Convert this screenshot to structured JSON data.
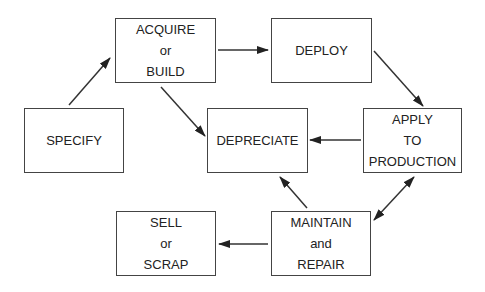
{
  "diagram": {
    "nodes": [
      {
        "id": "acquire",
        "lines": [
          "ACQUIRE",
          "or",
          "BUILD"
        ],
        "x": 115,
        "y": 18,
        "w": 101,
        "h": 65
      },
      {
        "id": "deploy",
        "lines": [
          "DEPLOY"
        ],
        "x": 271,
        "y": 18,
        "w": 101,
        "h": 65
      },
      {
        "id": "specify",
        "lines": [
          "SPECIFY"
        ],
        "x": 24,
        "y": 108,
        "w": 100,
        "h": 65
      },
      {
        "id": "depreciate",
        "lines": [
          "DEPRECIATE"
        ],
        "x": 207,
        "y": 108,
        "w": 101,
        "h": 65
      },
      {
        "id": "apply",
        "lines": [
          "APPLY",
          "TO",
          "PRODUCTION"
        ],
        "x": 363,
        "y": 108,
        "w": 99,
        "h": 65
      },
      {
        "id": "sell",
        "lines": [
          "SELL",
          "or",
          "SCRAP"
        ],
        "x": 116,
        "y": 211,
        "w": 100,
        "h": 65
      },
      {
        "id": "maintain",
        "lines": [
          "MAINTAIN",
          "and",
          "REPAIR"
        ],
        "x": 271,
        "y": 211,
        "w": 100,
        "h": 65
      }
    ],
    "edges": [
      {
        "from": "specify",
        "to": "acquire",
        "x1": 69,
        "y1": 105,
        "x2": 110,
        "y2": 58
      },
      {
        "from": "acquire",
        "to": "deploy",
        "x1": 218,
        "y1": 50,
        "x2": 268,
        "y2": 50
      },
      {
        "from": "acquire",
        "to": "depreciate",
        "x1": 161,
        "y1": 87,
        "x2": 205,
        "y2": 136
      },
      {
        "from": "deploy",
        "to": "apply",
        "x1": 374,
        "y1": 51,
        "x2": 423,
        "y2": 106
      },
      {
        "from": "apply",
        "to": "depreciate",
        "x1": 361,
        "y1": 140,
        "x2": 310,
        "y2": 140
      },
      {
        "from": "maintain",
        "to": "depreciate",
        "x1": 307,
        "y1": 208,
        "x2": 280,
        "y2": 177
      },
      {
        "from": "maintain",
        "to": "apply",
        "x1": 374,
        "y1": 220,
        "x2": 414,
        "y2": 177,
        "bidirectional": true
      },
      {
        "from": "maintain",
        "to": "sell",
        "x1": 268,
        "y1": 244,
        "x2": 219,
        "y2": 244
      }
    ],
    "colors": {
      "stroke": "#333333",
      "text": "#222222",
      "background": "#ffffff"
    }
  }
}
